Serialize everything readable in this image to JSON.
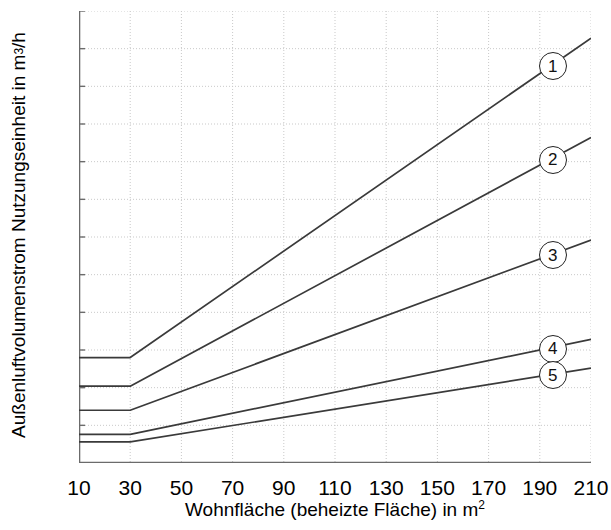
{
  "chart_data": {
    "type": "line",
    "title": "",
    "xlabel": "Wohnfläche (beheizte Fläche) in m",
    "xlabel_sup": "2",
    "ylabel": "Außenluftvolumenstrom Nutzungseinheit  in m",
    "ylabel_sup": "3",
    "ylabel_tail": "/h",
    "xlim": [
      10,
      210
    ],
    "ylim": [
      0,
      300
    ],
    "xticks": [
      10,
      30,
      50,
      70,
      90,
      110,
      130,
      150,
      170,
      190,
      210
    ],
    "yticks": [
      0,
      50,
      100,
      150,
      200,
      250,
      300
    ],
    "yminor_step": 25,
    "grid": true,
    "grid_color": "#c9c9c9",
    "line_color": "#3a3a3a",
    "legend": "callouts-at-right-ends",
    "x": [
      10,
      30,
      210
    ],
    "series": [
      {
        "name": "1",
        "label": "1",
        "values": [
          70,
          70,
          282
        ]
      },
      {
        "name": "2",
        "label": "2",
        "values": [
          51,
          51,
          216
        ]
      },
      {
        "name": "3",
        "label": "3",
        "values": [
          35,
          35,
          148
        ]
      },
      {
        "name": "4",
        "label": "4",
        "values": [
          19,
          19,
          82
        ]
      },
      {
        "name": "5",
        "label": "5",
        "values": [
          14,
          14,
          63
        ]
      }
    ]
  }
}
